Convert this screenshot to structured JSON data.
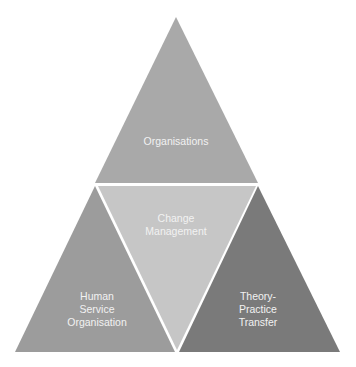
{
  "diagram": {
    "segments": [
      {
        "id": "top",
        "label": "Organisations",
        "color": "#a9a9a9"
      },
      {
        "id": "left",
        "label": "Human\nService\nOrganisation",
        "color": "#9c9c9c"
      },
      {
        "id": "center",
        "label": "Change\nManagement",
        "color": "#c6c6c6"
      },
      {
        "id": "right",
        "label": "Theory-\nPractice\nTransfer",
        "color": "#7a7a7a"
      }
    ]
  }
}
